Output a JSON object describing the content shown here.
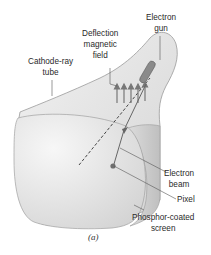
{
  "figure": {
    "caption": "(a)",
    "labels": {
      "electron_gun": [
        "Electron",
        "gun"
      ],
      "deflection_field": [
        "Deflection",
        "magnetic",
        "field"
      ],
      "crt": [
        "Cathode-ray",
        "tube"
      ],
      "electron_beam": [
        "Electron",
        "beam"
      ],
      "pixel": [
        "Pixel"
      ],
      "screen": [
        "Phosphor-coated",
        "screen"
      ]
    },
    "colors": {
      "tube_fill": "#e6e6e6",
      "tube_stroke": "#9a9a9a",
      "screen_fill": "#d9d9d9",
      "gun": "#8a8a8a",
      "arrows": "#777777",
      "pixel": "#6e6e6e",
      "leader_line": "#555555"
    }
  }
}
